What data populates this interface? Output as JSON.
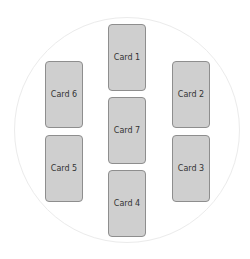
{
  "diagram": {
    "colors": {
      "card_fill": "#cfcfcf",
      "card_border": "#8e8e8e",
      "circle": "#ebebeb",
      "text": "#333333"
    },
    "cards": [
      {
        "id": 1,
        "label": "Card 1",
        "left": 108,
        "top": 24
      },
      {
        "id": 2,
        "label": "Card 2",
        "left": 172,
        "top": 61
      },
      {
        "id": 3,
        "label": "Card 3",
        "left": 172,
        "top": 135
      },
      {
        "id": 4,
        "label": "Card 4",
        "left": 108,
        "top": 170
      },
      {
        "id": 5,
        "label": "Card 5",
        "left": 45,
        "top": 135
      },
      {
        "id": 6,
        "label": "Card 6",
        "left": 45,
        "top": 61
      },
      {
        "id": 7,
        "label": "Card 7",
        "left": 108,
        "top": 97
      }
    ]
  }
}
